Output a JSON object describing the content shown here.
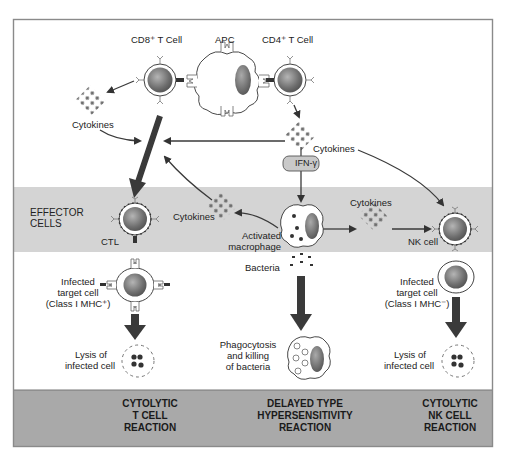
{
  "diagram": {
    "colors": {
      "frame": "#8a8a8a",
      "effector_band": "#d4d4d4",
      "bottom_band": "#a9a9a9",
      "cell_fill": "#7a7a7a",
      "arrow": "#3c3c3c",
      "cytokine_dot": "#6e6e6e"
    },
    "top_labels": {
      "cd8": "CD8⁺ T Cell",
      "apc": "APC",
      "cd4": "CD4⁺ T Cell"
    },
    "cytokines": {
      "left_top": "Cytokines",
      "right_top": "Cytokines",
      "middle_left": "Cytokines",
      "middle_right": "Cytokines"
    },
    "ifn_gamma": "IFN-γ",
    "effector_band_label_line1": "EFFECTOR",
    "effector_band_label_line2": "CELLS",
    "ctl": "CTL",
    "activated_macrophage_line1": "Activated",
    "activated_macrophage_line2": "macrophage",
    "nk_cell": "NK cell",
    "bacteria": "Bacteria",
    "left_target": {
      "line1": "Infected",
      "line2": "target cell",
      "line3": "(Class I MHC⁺)"
    },
    "right_target": {
      "line1": "Infected",
      "line2": "target cell",
      "line3": "(Class I MHC⁻)"
    },
    "left_lysis": {
      "line1": "Lysis of",
      "line2": "infected cell"
    },
    "right_lysis": {
      "line1": "Lysis of",
      "line2": "infected cell"
    },
    "phagocytosis": {
      "line1": "Phagocytosis",
      "line2": "and killing",
      "line3": "of bacteria"
    },
    "reactions": [
      {
        "line1": "CYTOLYTIC",
        "line2": "T CELL",
        "line3": "REACTION"
      },
      {
        "line1": "DELAYED TYPE",
        "line2": "HYPERSENSITIVITY",
        "line3": "REACTION"
      },
      {
        "line1": "CYTOLYTIC",
        "line2": "NK CELL",
        "line3": "REACTION"
      }
    ]
  }
}
